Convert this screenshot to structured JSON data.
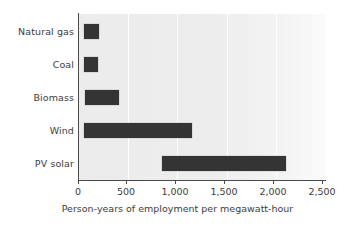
{
  "chart_data": {
    "type": "bar",
    "orientation": "horizontal",
    "title": "",
    "subtitle": "",
    "xlabel": "Person-years of employment per megawatt-hour",
    "ylabel": "",
    "categories": [
      "Natural gas",
      "Coal",
      "Biomass",
      "Wind",
      "PV solar"
    ],
    "bar_style": "floating-range",
    "ranges": [
      {
        "category": "Natural gas",
        "start": 65,
        "end": 210
      },
      {
        "category": "Coal",
        "start": 60,
        "end": 205
      },
      {
        "category": "Biomass",
        "start": 70,
        "end": 415
      },
      {
        "category": "Wind",
        "start": 60,
        "end": 1150
      },
      {
        "category": "PV solar",
        "start": 845,
        "end": 2100
      }
    ],
    "values": [
      145,
      145,
      345,
      1090,
      1255
    ],
    "xlim": [
      0,
      2500
    ],
    "ylim": null,
    "xticks": [
      0,
      500,
      1000,
      1500,
      2000,
      2500
    ],
    "xtick_labels": [
      "0",
      "500",
      "1,000",
      "1,500",
      "2,000",
      "2,500"
    ],
    "grid": true,
    "grid_axis": "x",
    "legend": null,
    "legend_position": "none",
    "colors": {
      "bar": "#343434",
      "plot_background": "#ececed",
      "gridline": "#ffffff",
      "axis": "#4a4a4a",
      "text": "#3d3d3d",
      "page_background": "#ffffff"
    }
  }
}
